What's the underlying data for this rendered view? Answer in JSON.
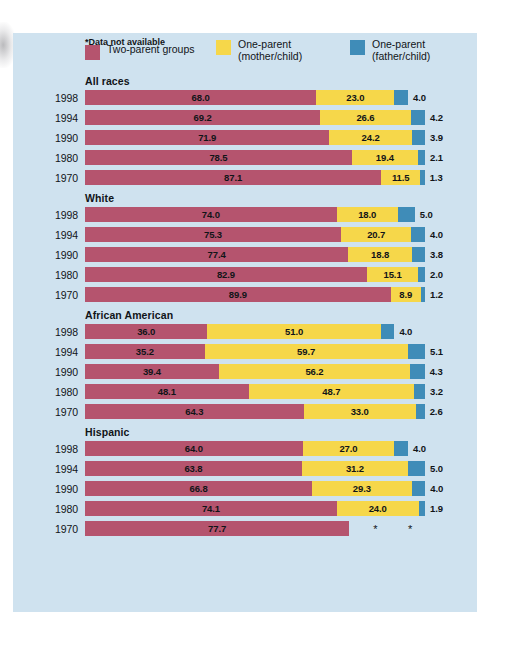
{
  "colors": {
    "two_parent": "#b5546e",
    "one_parent_mother": "#f6d74a",
    "one_parent_father": "#3f8cb8",
    "panel_background": "#cfe2ef",
    "text": "#111418"
  },
  "legend": [
    {
      "label": "Two-parent groups",
      "swatch": "maroon"
    },
    {
      "label": "One-parent\n(mother/child)",
      "swatch": "yellow"
    },
    {
      "label": "One-parent\n(father/child)",
      "swatch": "blue"
    }
  ],
  "footnote": "*Data not available",
  "chart_data": {
    "type": "bar",
    "orientation": "horizontal",
    "stacked": true,
    "title": "",
    "xlabel": "",
    "ylabel": "",
    "xlim": [
      0,
      100
    ],
    "grid": false,
    "legend_position": "top",
    "units": "percent",
    "series": [
      {
        "name": "Two-parent groups",
        "color": "#b5546e"
      },
      {
        "name": "One-parent (mother/child)",
        "color": "#f6d74a"
      },
      {
        "name": "One-parent (father/child)",
        "color": "#3f8cb8"
      }
    ],
    "groups": [
      {
        "name": "All races",
        "rows": [
          {
            "year": "1998",
            "two_parent": "68.0",
            "mother": "23.0",
            "father": "4.0"
          },
          {
            "year": "1994",
            "two_parent": "69.2",
            "mother": "26.6",
            "father": "4.2"
          },
          {
            "year": "1990",
            "two_parent": "71.9",
            "mother": "24.2",
            "father": "3.9"
          },
          {
            "year": "1980",
            "two_parent": "78.5",
            "mother": "19.4",
            "father": "2.1"
          },
          {
            "year": "1970",
            "two_parent": "87.1",
            "mother": "11.5",
            "father": "1.3"
          }
        ]
      },
      {
        "name": "White",
        "rows": [
          {
            "year": "1998",
            "two_parent": "74.0",
            "mother": "18.0",
            "father": "5.0"
          },
          {
            "year": "1994",
            "two_parent": "75.3",
            "mother": "20.7",
            "father": "4.0"
          },
          {
            "year": "1990",
            "two_parent": "77.4",
            "mother": "18.8",
            "father": "3.8"
          },
          {
            "year": "1980",
            "two_parent": "82.9",
            "mother": "15.1",
            "father": "2.0"
          },
          {
            "year": "1970",
            "two_parent": "89.9",
            "mother": "8.9",
            "father": "1.2"
          }
        ]
      },
      {
        "name": "African American",
        "rows": [
          {
            "year": "1998",
            "two_parent": "36.0",
            "mother": "51.0",
            "father": "4.0"
          },
          {
            "year": "1994",
            "two_parent": "35.2",
            "mother": "59.7",
            "father": "5.1"
          },
          {
            "year": "1990",
            "two_parent": "39.4",
            "mother": "56.2",
            "father": "4.3"
          },
          {
            "year": "1980",
            "two_parent": "48.1",
            "mother": "48.7",
            "father": "3.2"
          },
          {
            "year": "1970",
            "two_parent": "64.3",
            "mother": "33.0",
            "father": "2.6"
          }
        ]
      },
      {
        "name": "Hispanic",
        "rows": [
          {
            "year": "1998",
            "two_parent": "64.0",
            "mother": "27.0",
            "father": "4.0"
          },
          {
            "year": "1994",
            "two_parent": "63.8",
            "mother": "31.2",
            "father": "5.0"
          },
          {
            "year": "1990",
            "two_parent": "66.8",
            "mother": "29.3",
            "father": "4.0"
          },
          {
            "year": "1980",
            "two_parent": "74.1",
            "mother": "24.0",
            "father": "1.9"
          },
          {
            "year": "1970",
            "two_parent": "77.7",
            "mother": "*",
            "father": "*"
          }
        ]
      }
    ]
  }
}
